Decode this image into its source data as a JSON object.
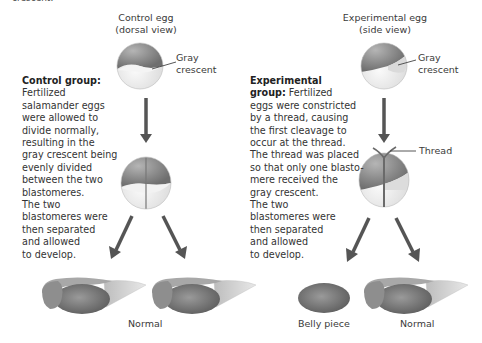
{
  "top_cut_text": "crescent.",
  "control": {
    "egg_title_line1": "Control egg",
    "egg_title_line2": "(dorsal view)",
    "gray_crescent_line1": "Gray",
    "gray_crescent_line2": "crescent",
    "heading": "Control group:",
    "description_lines": [
      "Fertilized",
      "salamander eggs",
      "were allowed to",
      "divide normally,",
      "resulting in the",
      "gray crescent being",
      "evenly divided",
      "between the two",
      "blastomeres.",
      "The two",
      "blastomeres were",
      "then separated",
      "and allowed",
      "to develop."
    ],
    "outcome_label": "Normal"
  },
  "experimental": {
    "egg_title_line1": "Experimental egg",
    "egg_title_line2": "(side view)",
    "gray_crescent_line1": "Gray",
    "gray_crescent_line2": "crescent",
    "heading_line1": "Experimental",
    "heading_line2": "group:",
    "first_line_rest": "Fertilized",
    "description_lines": [
      "eggs were constricted",
      "by a thread, causing",
      "the first cleavage to",
      "occur at the thread.",
      "The thread was placed",
      "so that only one blasto-",
      "mere received the",
      "gray crescent.",
      "The two",
      "blastomeres were",
      "then separated",
      "and allowed",
      "to develop."
    ],
    "thread_label": "Thread",
    "outcome_left_label": "Belly piece",
    "outcome_right_label": "Normal"
  },
  "bottom_cut_text": "... (cut off caption text) ...",
  "colors": {
    "animal_hemisphere": "#8a8a8a",
    "vegetal_hemisphere": "#ececec",
    "gray_crescent": "#d8d8d8",
    "arrow": "#555555",
    "text": "#333333"
  }
}
